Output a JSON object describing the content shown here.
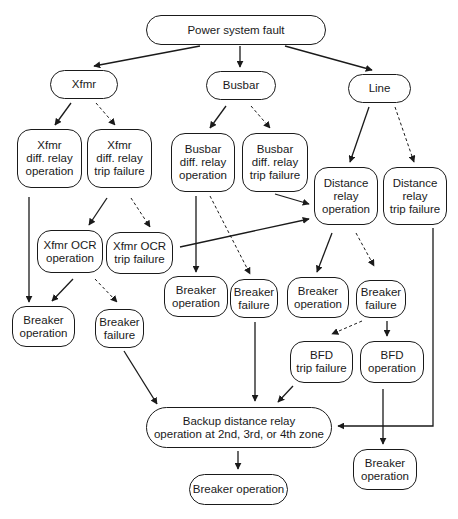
{
  "diagram": {
    "colors": {
      "stroke": "#1a1a1a",
      "background": "#ffffff"
    },
    "nodes": [
      {
        "id": "root",
        "label": "Power system fault",
        "x": 146,
        "y": 15,
        "w": 180,
        "h": 30,
        "shape": "pill"
      },
      {
        "id": "xfmr",
        "label": "Xfmr",
        "x": 50,
        "y": 70,
        "w": 68,
        "h": 29,
        "shape": "pill"
      },
      {
        "id": "busbar",
        "label": "Busbar",
        "x": 206,
        "y": 71,
        "w": 70,
        "h": 29,
        "shape": "pill"
      },
      {
        "id": "line",
        "label": "Line",
        "x": 348,
        "y": 74,
        "w": 63,
        "h": 29,
        "shape": "pill"
      },
      {
        "id": "xfmr_diff_op",
        "label": "Xfmr\ndiff. relay\noperation",
        "x": 17,
        "y": 129,
        "w": 65,
        "h": 59,
        "shape": "round"
      },
      {
        "id": "xfmr_diff_fail",
        "label": "Xfmr\ndiff. relay\ntrip failure",
        "x": 87,
        "y": 129,
        "w": 65,
        "h": 59,
        "shape": "round"
      },
      {
        "id": "bus_diff_op",
        "label": "Busbar\ndiff. relay\noperation",
        "x": 171,
        "y": 133,
        "w": 64,
        "h": 59,
        "shape": "round"
      },
      {
        "id": "bus_diff_fail",
        "label": "Busbar\ndiff. relay\ntrip failure",
        "x": 242,
        "y": 133,
        "w": 66,
        "h": 59,
        "shape": "round"
      },
      {
        "id": "dist_op",
        "label": "Distance\nrelay\noperation",
        "x": 314,
        "y": 167,
        "w": 64,
        "h": 58,
        "shape": "round"
      },
      {
        "id": "dist_fail",
        "label": "Distance\nrelay\ntrip failure",
        "x": 383,
        "y": 167,
        "w": 64,
        "h": 58,
        "shape": "round"
      },
      {
        "id": "xfmr_ocr_op",
        "label": "Xfmr OCR\noperation",
        "x": 37,
        "y": 230,
        "w": 66,
        "h": 43,
        "shape": "round"
      },
      {
        "id": "xfmr_ocr_fail",
        "label": "Xfmr OCR\ntrip failure",
        "x": 106,
        "y": 232,
        "w": 67,
        "h": 42,
        "shape": "round"
      },
      {
        "id": "brk_op_x",
        "label": "Breaker\noperation",
        "x": 12,
        "y": 306,
        "w": 63,
        "h": 41,
        "shape": "round"
      },
      {
        "id": "brk_fail_x",
        "label": "Breaker\nfailure",
        "x": 95,
        "y": 309,
        "w": 49,
        "h": 39,
        "shape": "round"
      },
      {
        "id": "brk_op_b",
        "label": "Breaker\noperation",
        "x": 164,
        "y": 276,
        "w": 64,
        "h": 41,
        "shape": "round"
      },
      {
        "id": "brk_fail_b",
        "label": "Breaker\nfailure",
        "x": 230,
        "y": 279,
        "w": 48,
        "h": 39,
        "shape": "round"
      },
      {
        "id": "brk_op_l",
        "label": "Breaker\noperation",
        "x": 287,
        "y": 277,
        "w": 62,
        "h": 41,
        "shape": "round"
      },
      {
        "id": "brk_fail_l",
        "label": "Breaker\nfailure",
        "x": 356,
        "y": 280,
        "w": 50,
        "h": 38,
        "shape": "round"
      },
      {
        "id": "bfd_fail",
        "label": "BFD\ntrip failure",
        "x": 290,
        "y": 341,
        "w": 63,
        "h": 42,
        "shape": "round"
      },
      {
        "id": "bfd_op",
        "label": "BFD\noperation",
        "x": 360,
        "y": 341,
        "w": 64,
        "h": 42,
        "shape": "round"
      },
      {
        "id": "backup",
        "label": "Backup distance relay\noperation at 2nd, 3rd, or 4th zone",
        "x": 146,
        "y": 407,
        "w": 186,
        "h": 41,
        "shape": "pill"
      },
      {
        "id": "brk_op_final",
        "label": "Breaker operation",
        "x": 189,
        "y": 474,
        "w": 99,
        "h": 31,
        "shape": "pill"
      },
      {
        "id": "brk_op_bfd",
        "label": "Breaker\noperation",
        "x": 353,
        "y": 449,
        "w": 64,
        "h": 41,
        "shape": "round"
      }
    ],
    "edges": [
      {
        "from": "root",
        "to": "xfmr",
        "style": "solid",
        "points": [
          [
            200,
            46
          ],
          [
            94,
            66
          ]
        ]
      },
      {
        "from": "root",
        "to": "busbar",
        "style": "solid",
        "points": [
          [
            240,
            46
          ],
          [
            240,
            67
          ]
        ]
      },
      {
        "from": "root",
        "to": "line",
        "style": "solid",
        "points": [
          [
            285,
            46
          ],
          [
            372,
            70
          ]
        ]
      },
      {
        "from": "xfmr",
        "to": "xfmr_diff_op",
        "style": "solid",
        "points": [
          [
            71,
            103
          ],
          [
            55,
            125
          ]
        ]
      },
      {
        "from": "xfmr",
        "to": "xfmr_diff_fail",
        "style": "dashed",
        "points": [
          [
            96,
            103
          ],
          [
            115,
            125
          ]
        ]
      },
      {
        "from": "busbar",
        "to": "bus_diff_op",
        "style": "solid",
        "points": [
          [
            226,
            106
          ],
          [
            210,
            128
          ]
        ]
      },
      {
        "from": "busbar",
        "to": "bus_diff_fail",
        "style": "dashed",
        "points": [
          [
            251,
            106
          ],
          [
            270,
            128
          ]
        ]
      },
      {
        "from": "line",
        "to": "dist_op",
        "style": "solid",
        "points": [
          [
            369,
            107
          ],
          [
            350,
            162
          ]
        ]
      },
      {
        "from": "line",
        "to": "dist_fail",
        "style": "dashed",
        "points": [
          [
            395,
            107
          ],
          [
            414,
            162
          ]
        ]
      },
      {
        "from": "xfmr_diff_op",
        "to": "brk_op_x",
        "style": "solid",
        "points": [
          [
            29,
            197
          ],
          [
            29,
            302
          ]
        ]
      },
      {
        "from": "xfmr_diff_fail",
        "to": "xfmr_ocr_op",
        "style": "solid",
        "points": [
          [
            107,
            198
          ],
          [
            89,
            225
          ]
        ]
      },
      {
        "from": "xfmr_diff_fail",
        "to": "xfmr_ocr_fail",
        "style": "dashed",
        "points": [
          [
            131,
            198
          ],
          [
            150,
            227
          ]
        ]
      },
      {
        "from": "bus_diff_op",
        "to": "brk_op_b",
        "style": "solid",
        "points": [
          [
            196,
            196
          ],
          [
            196,
            272
          ]
        ]
      },
      {
        "from": "bus_diff_op",
        "to": "brk_fail_b",
        "style": "dashed",
        "points": [
          [
            210,
            196
          ],
          [
            250,
            274
          ]
        ]
      },
      {
        "from": "bus_diff_fail",
        "to": "dist_op",
        "style": "solid",
        "points": [
          [
            275,
            194
          ],
          [
            309,
            204
          ]
        ]
      },
      {
        "from": "xfmr_ocr_fail",
        "to": "dist_op",
        "style": "solid",
        "points": [
          [
            180,
            247
          ],
          [
            309,
            219
          ]
        ]
      },
      {
        "from": "xfmr_ocr_op",
        "to": "brk_op_x",
        "style": "solid",
        "points": [
          [
            73,
            279
          ],
          [
            52,
            301
          ]
        ]
      },
      {
        "from": "xfmr_ocr_op",
        "to": "brk_fail_x",
        "style": "dashed",
        "points": [
          [
            95,
            279
          ],
          [
            117,
            302
          ]
        ]
      },
      {
        "from": "dist_op",
        "to": "brk_op_l",
        "style": "solid",
        "points": [
          [
            332,
            233
          ],
          [
            317,
            272
          ]
        ]
      },
      {
        "from": "dist_op",
        "to": "brk_fail_l",
        "style": "dashed",
        "points": [
          [
            356,
            233
          ],
          [
            374,
            266
          ]
        ]
      },
      {
        "from": "brk_fail_l",
        "to": "bfd_fail",
        "style": "dashed",
        "points": [
          [
            362,
            321
          ],
          [
            332,
            334
          ]
        ]
      },
      {
        "from": "brk_fail_l",
        "to": "bfd_op",
        "style": "solid",
        "points": [
          [
            387,
            321
          ],
          [
            387,
            336
          ]
        ]
      },
      {
        "from": "brk_fail_x",
        "to": "backup",
        "style": "solid",
        "points": [
          [
            124,
            351
          ],
          [
            157,
            404
          ]
        ]
      },
      {
        "from": "brk_fail_b",
        "to": "backup",
        "style": "solid",
        "points": [
          [
            255,
            322
          ],
          [
            255,
            401
          ]
        ]
      },
      {
        "from": "bfd_fail",
        "to": "backup",
        "style": "solid",
        "points": [
          [
            293,
            386
          ],
          [
            278,
            402
          ]
        ]
      },
      {
        "from": "dist_fail",
        "to": "backup",
        "style": "solid",
        "points": [
          [
            433,
            228
          ],
          [
            433,
            426
          ],
          [
            338,
            426
          ]
        ]
      },
      {
        "from": "bfd_op",
        "to": "brk_op_bfd",
        "style": "solid",
        "points": [
          [
            383,
            389
          ],
          [
            383,
            444
          ]
        ]
      },
      {
        "from": "backup",
        "to": "brk_op_final",
        "style": "solid",
        "points": [
          [
            238,
            451
          ],
          [
            238,
            469
          ]
        ]
      }
    ]
  }
}
